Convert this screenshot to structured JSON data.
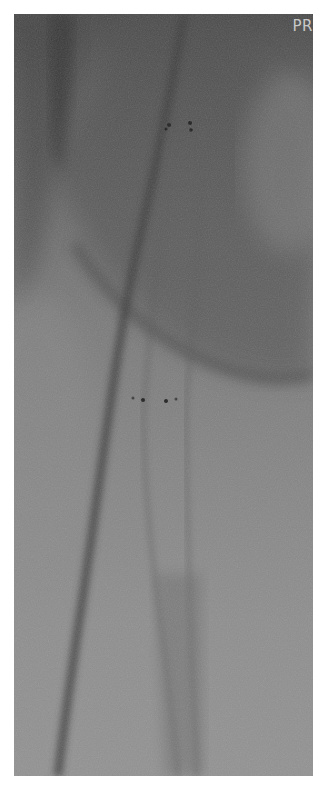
{
  "image": {
    "type": "fluoroscopy",
    "description": "Grayscale X-ray fluoroscopic image showing catheter/guidewire and stent-like mesh structure with radiopaque marker dots",
    "overlay_label": "PR",
    "colors": {
      "frame_top": "#4a4a4a",
      "frame_bottom": "#929292",
      "label": "#c8c8c8",
      "border": "#ffffff"
    },
    "markers": {
      "upper_pair_y": 124,
      "lower_pair_y": 398
    }
  }
}
